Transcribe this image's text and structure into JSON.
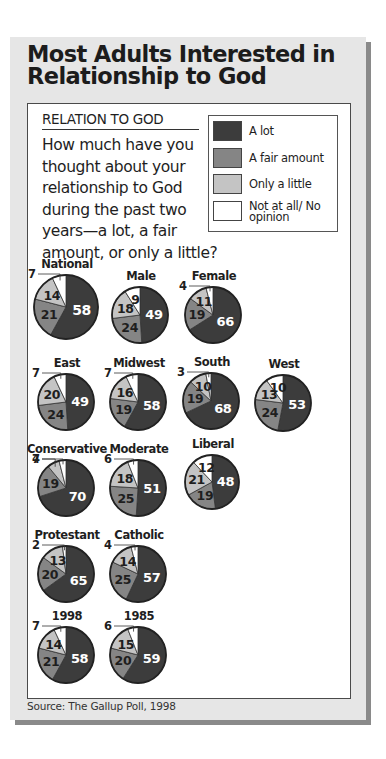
{
  "title": "Most Adults Interested in Relationship to God",
  "title_lines": [
    "Most Adults Interested in",
    "Relationship to God"
  ],
  "section_label": "RELATION TO GOD",
  "question": "How much have you thought about your relationship to God during the past two years—a lot, a fair amount, or only a little?",
  "legend": [
    {
      "label": "A lot",
      "color": "#3c3c3c"
    },
    {
      "label": "A fair amount",
      "color": "#858585"
    },
    {
      "label": "Only a little",
      "color": "#c4c4c4"
    },
    {
      "label": "Not at all/ No opinion",
      "color": "#ffffff"
    }
  ],
  "source": "Source: The Gallup Poll, 1998",
  "chart_data": {
    "type": "pie",
    "title": "Most Adults Interested in Relationship to God",
    "subtitle": "RELATION TO GOD",
    "categories": [
      "A lot",
      "A fair amount",
      "Only a little",
      "Not at all/No opinion"
    ],
    "legend_position": "top-right",
    "pies": [
      {
        "name": "National",
        "values": [
          58,
          21,
          14,
          7
        ]
      },
      {
        "name": "Male",
        "values": [
          49,
          24,
          18,
          9
        ]
      },
      {
        "name": "Female",
        "values": [
          66,
          19,
          11,
          4
        ]
      },
      {
        "name": "East",
        "values": [
          49,
          24,
          20,
          7
        ]
      },
      {
        "name": "Midwest",
        "values": [
          58,
          19,
          16,
          7
        ]
      },
      {
        "name": "South",
        "values": [
          68,
          19,
          10,
          3
        ]
      },
      {
        "name": "West",
        "values": [
          53,
          24,
          13,
          10
        ]
      },
      {
        "name": "Conservative",
        "values": [
          70,
          19,
          7,
          4
        ]
      },
      {
        "name": "Moderate",
        "values": [
          51,
          25,
          18,
          6
        ]
      },
      {
        "name": "Liberal",
        "values": [
          48,
          19,
          21,
          12
        ]
      },
      {
        "name": "Protestant",
        "values": [
          65,
          20,
          13,
          2
        ]
      },
      {
        "name": "Catholic",
        "values": [
          57,
          25,
          14,
          4
        ]
      },
      {
        "name": "1998",
        "values": [
          58,
          21,
          14,
          7
        ]
      },
      {
        "name": "1985",
        "values": [
          59,
          20,
          15,
          6
        ]
      }
    ]
  }
}
